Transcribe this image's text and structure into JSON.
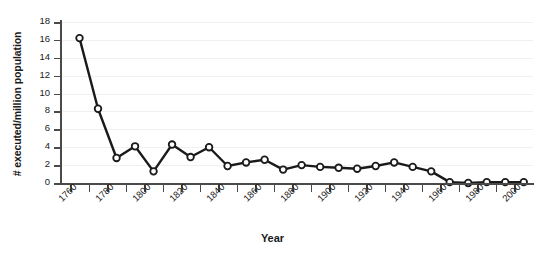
{
  "chart_data": {
    "type": "line",
    "title": "",
    "xlabel": "Year",
    "ylabel": "# executed/million population",
    "xlim": [
      1755,
      2010
    ],
    "ylim": [
      0,
      18
    ],
    "grid": true,
    "legend": "none",
    "marker": "open-circle",
    "line_color": "#1a1a1a",
    "marker_fill": "#ffffff",
    "grid_color": "#f0f0f0",
    "axis_color": "#4a4a4a",
    "y_ticks": [
      0,
      2,
      4,
      6,
      8,
      10,
      12,
      14,
      16,
      18
    ],
    "x_ticks": [
      1760,
      1770,
      1780,
      1790,
      1800,
      1810,
      1820,
      1830,
      1840,
      1850,
      1860,
      1870,
      1880,
      1890,
      1900,
      1910,
      1920,
      1930,
      1940,
      1950,
      1960,
      1970,
      1980,
      1990,
      2000
    ],
    "x_tick_labels": [
      1760,
      1780,
      1800,
      1820,
      1840,
      1860,
      1880,
      1900,
      1920,
      1940,
      1960,
      1980,
      2000
    ],
    "x": [
      1765,
      1775,
      1785,
      1795,
      1805,
      1815,
      1825,
      1835,
      1845,
      1855,
      1865,
      1875,
      1885,
      1895,
      1905,
      1915,
      1925,
      1935,
      1945,
      1955,
      1965,
      1975,
      1985,
      1995,
      2005
    ],
    "values": [
      16.2,
      8.3,
      2.8,
      4.1,
      1.3,
      4.3,
      2.9,
      4.0,
      1.9,
      2.3,
      2.6,
      1.5,
      2.0,
      1.8,
      1.7,
      1.6,
      1.9,
      2.3,
      1.8,
      1.3,
      0.1,
      0.0,
      0.1,
      0.1,
      0.1
    ],
    "series": [
      {
        "name": "executions per million population",
        "values": [
          16.2,
          8.3,
          2.8,
          4.1,
          1.3,
          4.3,
          2.9,
          4.0,
          1.9,
          2.3,
          2.6,
          1.5,
          2.0,
          1.8,
          1.7,
          1.6,
          1.9,
          2.3,
          1.8,
          1.3,
          0.1,
          0.0,
          0.1,
          0.1,
          0.1
        ]
      }
    ]
  }
}
